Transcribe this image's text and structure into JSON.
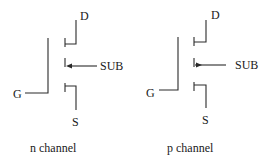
{
  "diagram": {
    "type": "MOSFET symbols",
    "transistors": [
      {
        "id": "n",
        "caption": "n channel",
        "labels": {
          "drain": "D",
          "gate": "G",
          "source": "S",
          "substrate": "SUB"
        },
        "substrate_arrow": "toward-channel"
      },
      {
        "id": "p",
        "caption": "p channel",
        "labels": {
          "drain": "D",
          "gate": "G",
          "source": "S",
          "substrate": "SUB"
        },
        "substrate_arrow": "away-from-channel"
      }
    ]
  }
}
